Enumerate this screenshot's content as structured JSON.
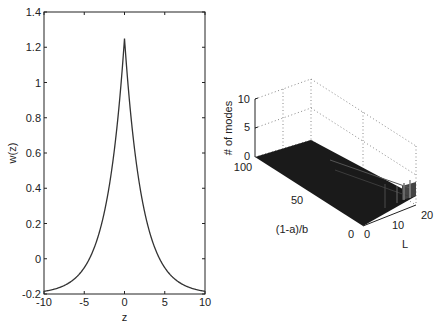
{
  "chart_data": [
    {
      "type": "line",
      "title": "",
      "xlabel": "z",
      "ylabel": "w(z)",
      "xlim": [
        -10,
        10
      ],
      "ylim": [
        -0.2,
        1.4
      ],
      "xticks": [
        "-10",
        "-5",
        "0",
        "5",
        "10"
      ],
      "yticks": [
        "-0.2",
        "0",
        "0.2",
        "0.4",
        "0.6",
        "0.8",
        "1",
        "1.2",
        "1.4"
      ],
      "grid": false,
      "series": [
        {
          "name": "w(z)",
          "x": [
            -10,
            -7.5,
            -5,
            -4,
            -3,
            -2.5,
            -2,
            -1.5,
            -1,
            -0.5,
            0,
            0.5,
            1,
            1.5,
            2,
            2.5,
            3,
            4,
            5,
            7.5,
            10
          ],
          "values": [
            -0.18,
            -0.15,
            -0.04,
            0.03,
            0.12,
            0.19,
            0.28,
            0.41,
            0.57,
            0.86,
            1.25,
            0.86,
            0.57,
            0.41,
            0.28,
            0.19,
            0.12,
            0.03,
            -0.04,
            -0.15,
            -0.18
          ]
        }
      ]
    },
    {
      "type": "surface3d",
      "title": "",
      "xlabel": "L",
      "ylabel": "(1-a)/b",
      "zlabel": "# of modes",
      "xlim": [
        0,
        20
      ],
      "ylim": [
        0,
        100
      ],
      "zlim": [
        0,
        10
      ],
      "xticks": [
        "0",
        "10",
        "20"
      ],
      "yticks": [
        "0",
        "50",
        "100"
      ],
      "zticks": [
        "0",
        "5",
        "10"
      ],
      "grid": true,
      "description": "Mostly flat dark surface near 0 modes; small raised bands near L≈18-20"
    }
  ],
  "left_plot": {
    "xlabel": "z",
    "ylabel": "w(z)",
    "xticks": [
      "-10",
      "-5",
      "0",
      "5",
      "10"
    ],
    "yticks": [
      "-0.2",
      "0",
      "0.2",
      "0.4",
      "0.6",
      "0.8",
      "1",
      "1.2",
      "1.4"
    ]
  },
  "right_plot": {
    "zlabel": "# of modes",
    "ylabel": "(1-a)/b",
    "xlabel": "L",
    "zticks": [
      "0",
      "5",
      "10"
    ],
    "yticks": [
      "100",
      "50",
      "0"
    ],
    "xticks": [
      "0",
      "10",
      "20"
    ]
  }
}
